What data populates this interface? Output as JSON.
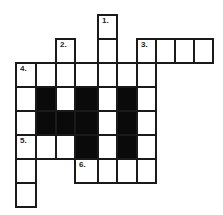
{
  "puzzle": {
    "type": "crossword",
    "colors": {
      "cell": "#ffffff",
      "block": "#0a0a0a",
      "border": "#1a1a1a"
    },
    "cells": [
      {
        "r": 0,
        "c": 4,
        "n": "1."
      },
      {
        "r": 1,
        "c": 2,
        "n": "2."
      },
      {
        "r": 1,
        "c": 4
      },
      {
        "r": 1,
        "c": 6,
        "n": "3."
      },
      {
        "r": 1,
        "c": 7
      },
      {
        "r": 1,
        "c": 8
      },
      {
        "r": 1,
        "c": 9
      },
      {
        "r": 2,
        "c": 0,
        "n": "4."
      },
      {
        "r": 2,
        "c": 1
      },
      {
        "r": 2,
        "c": 2
      },
      {
        "r": 2,
        "c": 3
      },
      {
        "r": 2,
        "c": 4
      },
      {
        "r": 2,
        "c": 5
      },
      {
        "r": 2,
        "c": 6
      },
      {
        "r": 3,
        "c": 0
      },
      {
        "r": 3,
        "c": 1,
        "b": true
      },
      {
        "r": 3,
        "c": 2
      },
      {
        "r": 3,
        "c": 3,
        "b": true
      },
      {
        "r": 3,
        "c": 4
      },
      {
        "r": 3,
        "c": 5,
        "b": true
      },
      {
        "r": 3,
        "c": 6
      },
      {
        "r": 4,
        "c": 0
      },
      {
        "r": 4,
        "c": 1,
        "b": true
      },
      {
        "r": 4,
        "c": 2,
        "b": true
      },
      {
        "r": 4,
        "c": 3,
        "b": true
      },
      {
        "r": 4,
        "c": 4
      },
      {
        "r": 4,
        "c": 5,
        "b": true
      },
      {
        "r": 4,
        "c": 6
      },
      {
        "r": 5,
        "c": 0,
        "n": "5."
      },
      {
        "r": 5,
        "c": 1
      },
      {
        "r": 5,
        "c": 2
      },
      {
        "r": 5,
        "c": 3,
        "b": true
      },
      {
        "r": 5,
        "c": 4
      },
      {
        "r": 5,
        "c": 5,
        "b": true
      },
      {
        "r": 5,
        "c": 6
      },
      {
        "r": 6,
        "c": 0
      },
      {
        "r": 6,
        "c": 3,
        "n": "6."
      },
      {
        "r": 6,
        "c": 4
      },
      {
        "r": 6,
        "c": 5
      },
      {
        "r": 6,
        "c": 6
      },
      {
        "r": 7,
        "c": 0
      }
    ]
  }
}
